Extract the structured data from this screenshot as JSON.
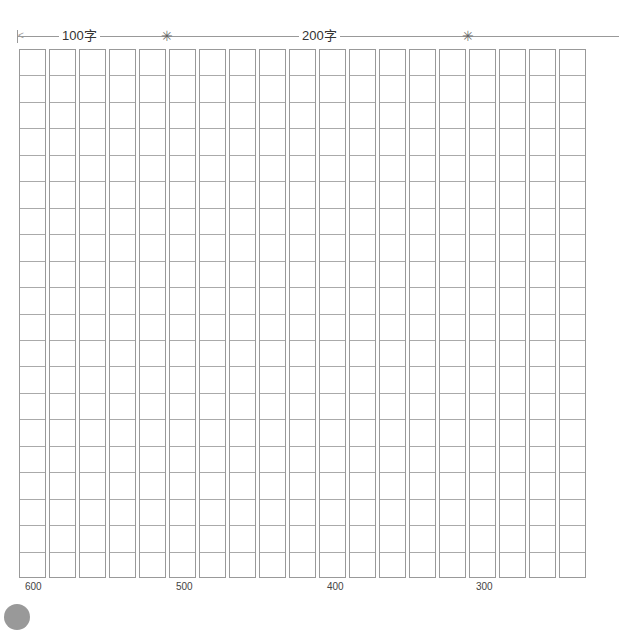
{
  "header": {
    "labels": [
      {
        "text": "100字",
        "x": 59
      },
      {
        "text": "200字",
        "x": 299
      }
    ],
    "markers_x": [
      160,
      461
    ]
  },
  "grid": {
    "columns": 19,
    "rows": 20,
    "col_width": 30,
    "row_height": 26.45
  },
  "footer": {
    "numbers": [
      {
        "text": "600",
        "x": 25
      },
      {
        "text": "500",
        "x": 176
      },
      {
        "text": "400",
        "x": 327
      },
      {
        "text": "300",
        "x": 476
      }
    ]
  },
  "colors": {
    "line": "#999999",
    "text": "#333333",
    "dot": "#999999"
  }
}
